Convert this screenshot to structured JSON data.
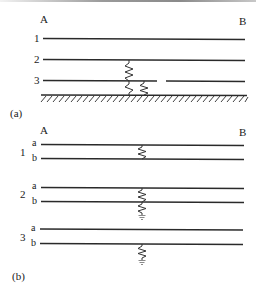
{
  "figure": {
    "part_a": {
      "caption": "(a)",
      "end_left": "A",
      "end_right": "B",
      "lines": [
        {
          "label": "1",
          "description": "healthy conductor"
        },
        {
          "label": "2",
          "description": "conductor faulted to ground via resistance"
        },
        {
          "label": "3",
          "description": "broken conductor faulted to ground via resistance"
        }
      ],
      "ground": "earth (hatched)"
    },
    "part_b": {
      "caption": "(b)",
      "end_left": "A",
      "end_right": "B",
      "groups": [
        {
          "label": "1",
          "sub_a": "a",
          "sub_b": "b",
          "fault": "resistance between a and b"
        },
        {
          "label": "2",
          "sub_a": "a",
          "sub_b": "b",
          "fault": "resistance between a and b, plus b to ground"
        },
        {
          "label": "3",
          "sub_a": "a",
          "sub_b": "b",
          "fault": "resistance from b to ground"
        }
      ]
    },
    "colors": {
      "line": "#2a2a2a",
      "resistor": "#333333",
      "ground_symbol": "#8a8a8a"
    }
  }
}
